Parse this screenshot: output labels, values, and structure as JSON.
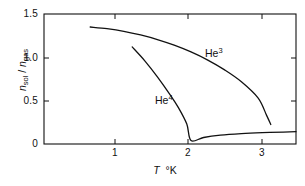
{
  "chart_data": {
    "type": "line",
    "title": "",
    "xlabel": "T  °K",
    "xlabel_parts": {
      "symbol": "T",
      "unit": "°K"
    },
    "ylabel": "n_sol / n_gas",
    "ylabel_parts": {
      "num_base": "n",
      "num_sub": "sol",
      "sep": "/",
      "den_base": "n",
      "den_sub": "gas"
    },
    "xlim": [
      0.45,
      3.45
    ],
    "ylim": [
      0,
      1.5
    ],
    "xticks": [
      1,
      2,
      3
    ],
    "xticklabels": [
      "1",
      "2",
      "3"
    ],
    "yticks": [
      0,
      0.5,
      1.0,
      1.5
    ],
    "yticklabels": [
      "0",
      "0.5",
      "1.0",
      "1.5"
    ],
    "grid": false,
    "legend": "inline-annotations",
    "frame": "box",
    "tick_direction": "in",
    "line_color": "#111111",
    "series": [
      {
        "name": "He3",
        "label": "He",
        "label_sup": "3",
        "points": [
          [
            1.0,
            1.35
          ],
          [
            1.2,
            1.33
          ],
          [
            1.4,
            1.3
          ],
          [
            1.6,
            1.258
          ],
          [
            1.8,
            1.205
          ],
          [
            2.0,
            1.14
          ],
          [
            2.2,
            1.062
          ],
          [
            2.4,
            0.968
          ],
          [
            2.6,
            0.855
          ],
          [
            2.8,
            0.718
          ],
          [
            3.0,
            0.53
          ],
          [
            3.1,
            0.33
          ],
          [
            3.15,
            0.225
          ]
        ]
      },
      {
        "name": "He4",
        "label": "He",
        "label_sup": "4",
        "points": [
          [
            1.5,
            1.12
          ],
          [
            1.65,
            0.96
          ],
          [
            1.8,
            0.775
          ],
          [
            1.95,
            0.57
          ],
          [
            2.05,
            0.42
          ],
          [
            2.15,
            0.23
          ],
          [
            2.2,
            0.04
          ],
          [
            2.35,
            0.075
          ],
          [
            2.55,
            0.102
          ],
          [
            2.8,
            0.12
          ],
          [
            3.05,
            0.131
          ],
          [
            3.3,
            0.138
          ],
          [
            3.45,
            0.142
          ]
        ]
      }
    ]
  },
  "axis": {
    "y_tick_0": "0",
    "y_tick_1": "0.5",
    "y_tick_2": "1.0",
    "y_tick_3": "1.5",
    "x_tick_0": "1",
    "x_tick_1": "2",
    "x_tick_2": "3"
  },
  "labels": {
    "he3_base": "He",
    "he3_sup": "3",
    "he4_base": "He",
    "he4_sup": "4",
    "x_symbol": "T",
    "x_unit": "°K",
    "y_num_base": "n",
    "y_num_sub": "sol",
    "y_sep": "/",
    "y_den_base": "n",
    "y_den_sub": "gas"
  }
}
